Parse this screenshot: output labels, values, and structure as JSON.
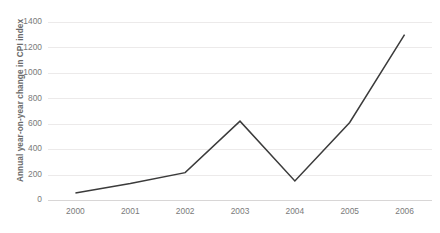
{
  "chart_data": {
    "type": "line",
    "title": "",
    "subtitle": "",
    "xlabel": "",
    "ylabel": "Annual year-on-year change in CPI index",
    "categories": [
      "2000",
      "2001",
      "2002",
      "2003",
      "2004",
      "2005",
      "2006"
    ],
    "x": [
      2000,
      2001,
      2002,
      2003,
      2004,
      2005,
      2006
    ],
    "values": [
      55,
      130,
      215,
      620,
      150,
      610,
      1300
    ],
    "series": [
      {
        "name": "Annual year-on-year change in CPI index",
        "values": [
          55,
          130,
          215,
          620,
          150,
          610,
          1300
        ],
        "color": "#3b3b3b"
      }
    ],
    "ylim": [
      0,
      1400
    ],
    "yticks": [
      0,
      200,
      400,
      600,
      800,
      1000,
      1200,
      1400
    ],
    "ytick_labels": [
      "0",
      "200",
      "400",
      "600",
      "800",
      "1000",
      "1200",
      "1400"
    ],
    "xtick_labels": [
      "2000",
      "2001",
      "2002",
      "2003",
      "2004",
      "2005",
      "2006"
    ],
    "grid": "horizontal",
    "grid_color": "#eceaea",
    "legend": "none",
    "legend_position": "none",
    "background": "#ffffff",
    "annotations": []
  },
  "axes": {
    "y_title": "Annual year-on-year change in CPI index"
  }
}
